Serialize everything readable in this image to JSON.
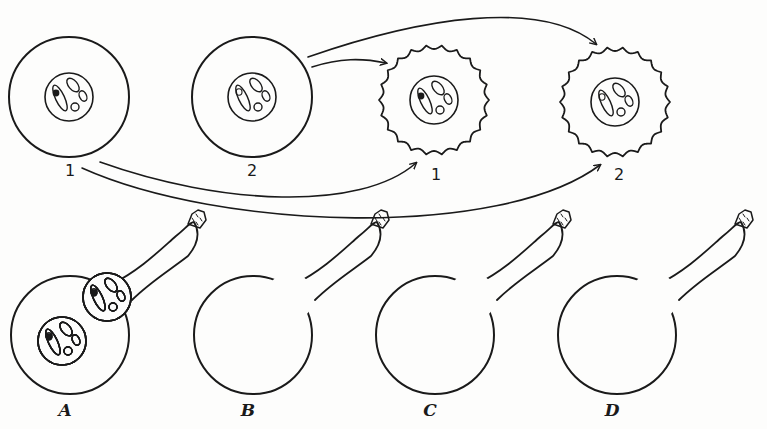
{
  "diagram": {
    "type": "biology-illustration",
    "colors": {
      "ink": "#1a1a1a",
      "paper": "#fdfdfc"
    },
    "top_row": {
      "cells": [
        {
          "id": "egg-1",
          "label": "1",
          "shape": "smooth-circle",
          "marked_chromosome": true
        },
        {
          "id": "egg-2",
          "label": "2",
          "shape": "smooth-circle",
          "marked_chromosome": false
        },
        {
          "id": "result-1",
          "label": "1",
          "shape": "wavy-circle",
          "marked_chromosome": true
        },
        {
          "id": "result-2",
          "label": "2",
          "shape": "wavy-circle",
          "marked_chromosome": false
        }
      ],
      "arrows": [
        {
          "from": "egg-2",
          "to": "result-1"
        },
        {
          "from": "egg-2",
          "to": "result-2"
        },
        {
          "from": "egg-1",
          "to": "result-1"
        },
        {
          "from": "egg-1",
          "to": "result-2"
        }
      ]
    },
    "bottom_row": {
      "cells": [
        {
          "id": "A",
          "label": "A",
          "egg_nucleus_marked": true,
          "pollen_nucleus_marked": true
        },
        {
          "id": "B",
          "label": "B",
          "egg_nucleus_marked": true,
          "pollen_nucleus_marked": false
        },
        {
          "id": "C",
          "label": "C",
          "egg_nucleus_marked": false,
          "pollen_nucleus_marked": true
        },
        {
          "id": "D",
          "label": "D",
          "egg_nucleus_marked": false,
          "pollen_nucleus_marked": false
        }
      ]
    }
  }
}
